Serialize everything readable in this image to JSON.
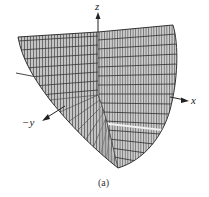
{
  "figure": {
    "caption": "(a)",
    "surface": "paraboloid wireframe",
    "axes": {
      "z_label": "z",
      "x_label": "x",
      "y_label": "−y"
    },
    "colors": {
      "background": "#ffffff",
      "mesh_fill": "#bdbdbd",
      "mesh_line": "#3a3a3a",
      "axis": "#222222"
    }
  }
}
